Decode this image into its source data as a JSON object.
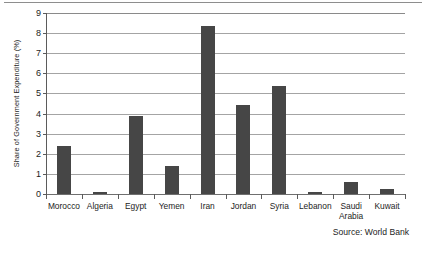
{
  "chart_data": {
    "type": "bar",
    "title": "",
    "subtitle": "",
    "xlabel": "",
    "ylabel": "Share of Government Expenditure (%)",
    "ylim": [
      0,
      9
    ],
    "yticks": [
      0,
      1,
      2,
      3,
      4,
      5,
      6,
      7,
      8,
      9
    ],
    "ytick_labels": [
      "0",
      "1",
      "2",
      "3",
      "4",
      "5",
      "6",
      "7",
      "8",
      "9"
    ],
    "grid": "horizontal",
    "legend": "none",
    "categories": [
      "Morocco",
      "Algeria",
      "Egypt",
      "Yemen",
      "Iran",
      "Jordan",
      "Syria",
      "Lebanon",
      "Saudi Arabia",
      "Kuwait"
    ],
    "values": [
      2.4,
      0.1,
      3.9,
      1.4,
      8.35,
      4.45,
      5.35,
      0.1,
      0.6,
      0.25
    ],
    "bar_color": "#464646",
    "annotations": [
      "Source: World Bank"
    ]
  },
  "source_note": "Source: World Bank"
}
